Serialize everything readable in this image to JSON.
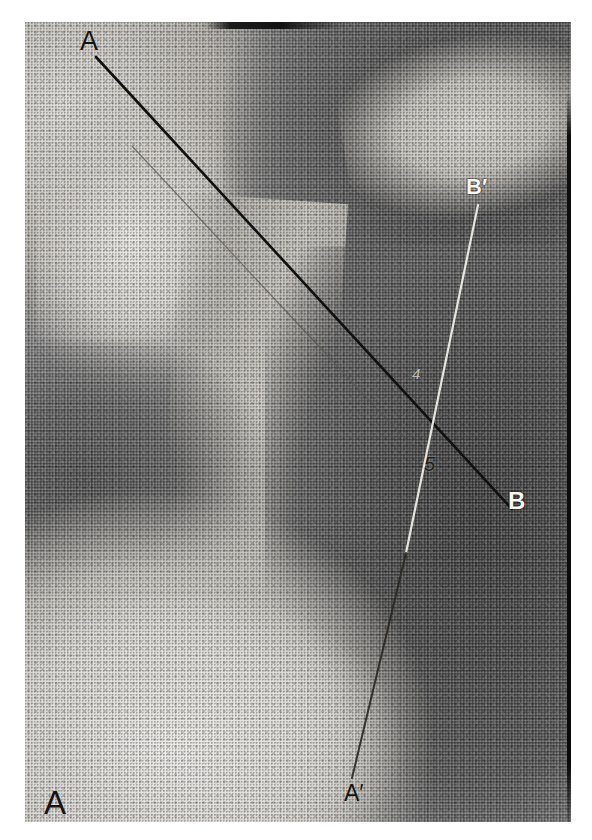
{
  "figure": {
    "panel_label": "A",
    "modality": "radiograph"
  },
  "annotations": {
    "lines": [
      {
        "name": "axis-A-B",
        "start_label": "A",
        "end_label": "B",
        "x1": 96,
        "y1": 57,
        "x2": 512,
        "y2": 509,
        "stroke": "#121212",
        "width": 2.6,
        "style": "solid-dark"
      },
      {
        "name": "axis-A-B-parallel",
        "start_label": "",
        "end_label": "",
        "x1": 132,
        "y1": 146,
        "x2": 436,
        "y2": 472,
        "stroke": "#4d4a45",
        "width": 1.1,
        "style": "faint-parallel"
      },
      {
        "name": "axis-B-prime-A-prime",
        "start_label": "B'",
        "end_label": "A'",
        "x1": 478,
        "y1": 205,
        "x2": 352,
        "y2": 778,
        "stroke": "#efede8",
        "width": 2.2,
        "style": "solid-light"
      }
    ],
    "intersection": {
      "name": "axis-crossing",
      "x": 426,
      "y": 420
    },
    "labels": [
      {
        "name": "label-A",
        "text": "A",
        "x": 80,
        "y": 28,
        "tone": "dark"
      },
      {
        "name": "label-A-prime",
        "text": "A′",
        "x": 344,
        "y": 782,
        "tone": "dark"
      },
      {
        "name": "label-B-prime",
        "text": "B′",
        "x": 466,
        "y": 176,
        "tone": "light"
      },
      {
        "name": "label-B",
        "text": "B",
        "x": 508,
        "y": 489,
        "tone": "light"
      },
      {
        "name": "label-panel-A",
        "text": "A",
        "x": 44,
        "y": 786,
        "tone": "dark"
      },
      {
        "name": "mark-4",
        "text": "4",
        "x": 412,
        "y": 366,
        "tone": "faint"
      },
      {
        "name": "mark-5",
        "text": "5",
        "x": 424,
        "y": 454,
        "tone": "dark"
      }
    ]
  },
  "colors": {
    "background": "#ffffff",
    "film_base": "#8d8d8d",
    "line_dark": "#121212",
    "line_light": "#efede8",
    "label_dark": "#15130f",
    "label_light": "#f7f6f3",
    "edge_border": "#0a0a0a"
  },
  "plate": {
    "left": 25,
    "top": 22,
    "width": 546,
    "height": 800
  }
}
